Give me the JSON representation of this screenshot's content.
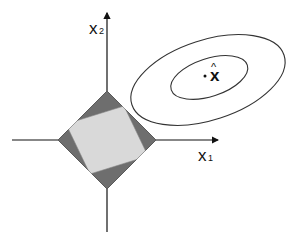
{
  "diagram": {
    "axes": {
      "x_label": "x",
      "x_subscript": "1",
      "y_label": "x",
      "y_subscript": "2",
      "origin": [
        107,
        140
      ]
    },
    "constraint_region": {
      "shape": "diamond",
      "outer_color": "#707070",
      "inner_band_color": "#d8d8d8",
      "edge_color": "#555555"
    },
    "contours": {
      "count": 2,
      "stroke_color": "#333333"
    },
    "estimate": {
      "label": "x",
      "accent": "^",
      "marker": "·"
    }
  }
}
